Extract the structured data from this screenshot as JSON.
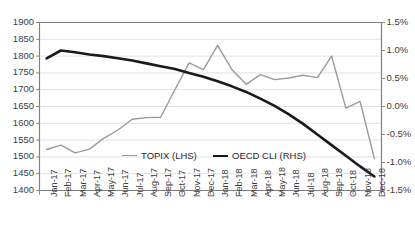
{
  "chart_data": {
    "type": "line",
    "title": "",
    "xlabel": "",
    "ylabel": "",
    "grid": true,
    "legend_position": "inside-bottom-center",
    "categories": [
      "Jan-17",
      "Feb-17",
      "Mar-17",
      "Apr-17",
      "May-17",
      "Jun-17",
      "Jul-17",
      "Aug-17",
      "Sep-17",
      "Oct-17",
      "Nov-17",
      "Dec-17",
      "Jan-18",
      "Feb-18",
      "Mar-18",
      "Apr-18",
      "May-18",
      "Jun-18",
      "Jul-18",
      "Aug-18",
      "Sep-18",
      "Oct-18",
      "Nov-18",
      "Dec-18"
    ],
    "axes": {
      "left": {
        "label": "",
        "ylim": [
          1400,
          1900
        ],
        "ticks": [
          1400,
          1450,
          1500,
          1550,
          1600,
          1650,
          1700,
          1750,
          1800,
          1850,
          1900
        ],
        "tick_labels": [
          "1400",
          "1450",
          "1500",
          "1550",
          "1600",
          "1650",
          "1700",
          "1750",
          "1800",
          "1850",
          "1900"
        ]
      },
      "right": {
        "label": "",
        "ylim": [
          -1.5,
          1.5
        ],
        "ticks": [
          -1.5,
          -1.0,
          -0.5,
          0.0,
          0.5,
          1.0,
          1.5
        ],
        "tick_labels": [
          "-1.5%",
          "-1.0%",
          "-0.5%",
          "0.0%",
          "0.5%",
          "1.0%",
          "1.5%"
        ]
      }
    },
    "series": [
      {
        "name": "TOPIX (LHS)",
        "axis": "left",
        "color": "#9a9a9a",
        "width": 1.4,
        "values": [
          1522,
          1535,
          1512,
          1523,
          1555,
          1580,
          1612,
          1617,
          1618,
          1700,
          1780,
          1760,
          1832,
          1760,
          1716,
          1745,
          1730,
          1735,
          1743,
          1736,
          1800,
          1645,
          1665,
          1495
        ]
      },
      {
        "name": "OECD CLI (RHS)",
        "axis": "right",
        "color": "#1a1a1a",
        "width": 2.6,
        "values": [
          0.86,
          1.0,
          0.97,
          0.93,
          0.9,
          0.86,
          0.82,
          0.77,
          0.72,
          0.67,
          0.6,
          0.53,
          0.45,
          0.36,
          0.26,
          0.14,
          0.01,
          -0.14,
          -0.31,
          -0.5,
          -0.69,
          -0.88,
          -1.07,
          -1.25
        ]
      }
    ],
    "legend": [
      {
        "label": "TOPIX (LHS)",
        "color": "#9a9a9a",
        "key": "topix"
      },
      {
        "label": "OECD CLI (RHS)",
        "color": "#1a1a1a",
        "key": "oecd"
      }
    ]
  }
}
